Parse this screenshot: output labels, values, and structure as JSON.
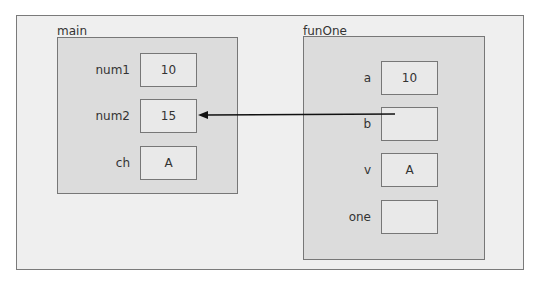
{
  "scopes": {
    "main": {
      "title": "main",
      "vars": [
        {
          "name": "num1",
          "value": "10"
        },
        {
          "name": "num2",
          "value": "15"
        },
        {
          "name": "ch",
          "value": "A"
        }
      ]
    },
    "funOne": {
      "title": "funOne",
      "vars": [
        {
          "name": "a",
          "value": "10"
        },
        {
          "name": "b",
          "value": ""
        },
        {
          "name": "v",
          "value": "A"
        },
        {
          "name": "one",
          "value": ""
        }
      ]
    }
  },
  "arrow": {
    "from": "funOne.b",
    "to": "main.num2"
  }
}
